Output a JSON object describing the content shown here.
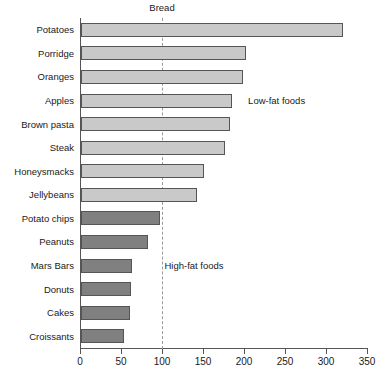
{
  "chart_data": {
    "type": "bar",
    "orientation": "horizontal",
    "title": "",
    "xlabel": "",
    "ylabel": "",
    "xlim": [
      0,
      350
    ],
    "grid": false,
    "legend_position": "none",
    "categories": [
      "Potatoes",
      "Porridge",
      "Oranges",
      "Apples",
      "Brown pasta",
      "Steak",
      "Honeysmacks",
      "Jellybeans",
      "Potato chips",
      "Peanuts",
      "Mars Bars",
      "Donuts",
      "Cakes",
      "Croissants"
    ],
    "values": [
      320,
      201,
      198,
      184,
      182,
      176,
      150,
      141,
      96,
      82,
      62,
      61,
      60,
      52
    ],
    "groups": [
      "low-fat",
      "low-fat",
      "low-fat",
      "low-fat",
      "low-fat",
      "low-fat",
      "low-fat",
      "low-fat",
      "high-fat",
      "high-fat",
      "high-fat",
      "high-fat",
      "high-fat",
      "high-fat"
    ],
    "xticks": [
      0,
      50,
      100,
      150,
      200,
      250,
      300,
      350
    ],
    "xtick_labels": [
      "0",
      "50",
      "100",
      "150",
      "200",
      "250",
      "300",
      "350"
    ],
    "reference_line": {
      "label": "Bread",
      "value": 100,
      "style": "dashed"
    },
    "annotations": [
      {
        "text": "Low-fat foods",
        "x": 205,
        "y_category": "Apples"
      },
      {
        "text": "High-fat foods",
        "x": 103,
        "y_category": "Mars Bars"
      }
    ],
    "colors": {
      "low_fat_fill": "#c9c9c9",
      "high_fat_fill": "#808080",
      "bar_edge": "#555555",
      "axis": "#555555",
      "reference_line": "#9a9a9a",
      "text": "#1a1a1a",
      "background": "#ffffff"
    }
  }
}
